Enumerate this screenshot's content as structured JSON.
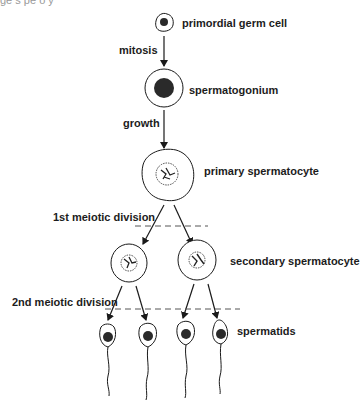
{
  "figure": {
    "top_cropped_text": "ge s pe o y",
    "labels": {
      "primordial_germ_cell": "primordial germ cell",
      "mitosis": "mitosis",
      "spermatogonium": "spermatogonium",
      "growth": "growth",
      "primary_spermatocyte": "primary spermatocyte",
      "first_meiotic_division": "1st meiotic division",
      "secondary_spermatocyte": "secondary spermatocyte",
      "second_meiotic_division": "2nd meiotic division",
      "spermatids": "spermatids"
    },
    "stages": [
      {
        "name": "primordial germ cell",
        "count": 1
      },
      {
        "name": "spermatogonium",
        "count": 1
      },
      {
        "name": "primary spermatocyte",
        "count": 1
      },
      {
        "name": "secondary spermatocyte",
        "count": 2
      },
      {
        "name": "spermatids",
        "count": 4
      }
    ],
    "transitions": [
      "mitosis",
      "growth",
      "1st meiotic division",
      "2nd meiotic division"
    ],
    "colors": {
      "ink": "#1a1a1a",
      "background": "#ffffff",
      "dashed_line": "#555555"
    }
  }
}
